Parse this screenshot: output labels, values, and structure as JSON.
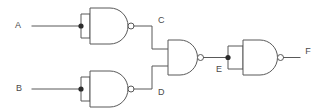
{
  "diagram": {
    "type": "logic-circuit-schematic",
    "background_color": "#ffffff",
    "line_color": "#595959",
    "label_color": "#4a4a4a",
    "labels": {
      "input_a": "A",
      "input_b": "B",
      "node_c": "C",
      "node_d": "D",
      "node_e": "E",
      "output_f": "F"
    },
    "gates": [
      {
        "id": "gate-top",
        "type": "NAND",
        "configuration": "inputs-tied-inverter",
        "inputs": [
          "A",
          "A"
        ],
        "output": "C"
      },
      {
        "id": "gate-bottom",
        "type": "NAND",
        "configuration": "inputs-tied-inverter",
        "inputs": [
          "B",
          "B"
        ],
        "output": "D"
      },
      {
        "id": "gate-middle",
        "type": "NAND",
        "configuration": "two-input",
        "inputs": [
          "C",
          "D"
        ],
        "output": "E"
      },
      {
        "id": "gate-output",
        "type": "NAND",
        "configuration": "inputs-tied-inverter",
        "inputs": [
          "E",
          "E"
        ],
        "output": "F"
      }
    ],
    "nets": [
      {
        "name": "A",
        "from": "input-a-terminal",
        "to": "gate-top-inputs"
      },
      {
        "name": "B",
        "from": "input-b-terminal",
        "to": "gate-bottom-inputs"
      },
      {
        "name": "C",
        "from": "gate-top-output",
        "to": "gate-middle-input-1"
      },
      {
        "name": "D",
        "from": "gate-bottom-output",
        "to": "gate-middle-input-2"
      },
      {
        "name": "E",
        "from": "gate-middle-output",
        "to": "gate-output-inputs"
      },
      {
        "name": "F",
        "from": "gate-output-output",
        "to": "output-f-terminal"
      }
    ]
  }
}
